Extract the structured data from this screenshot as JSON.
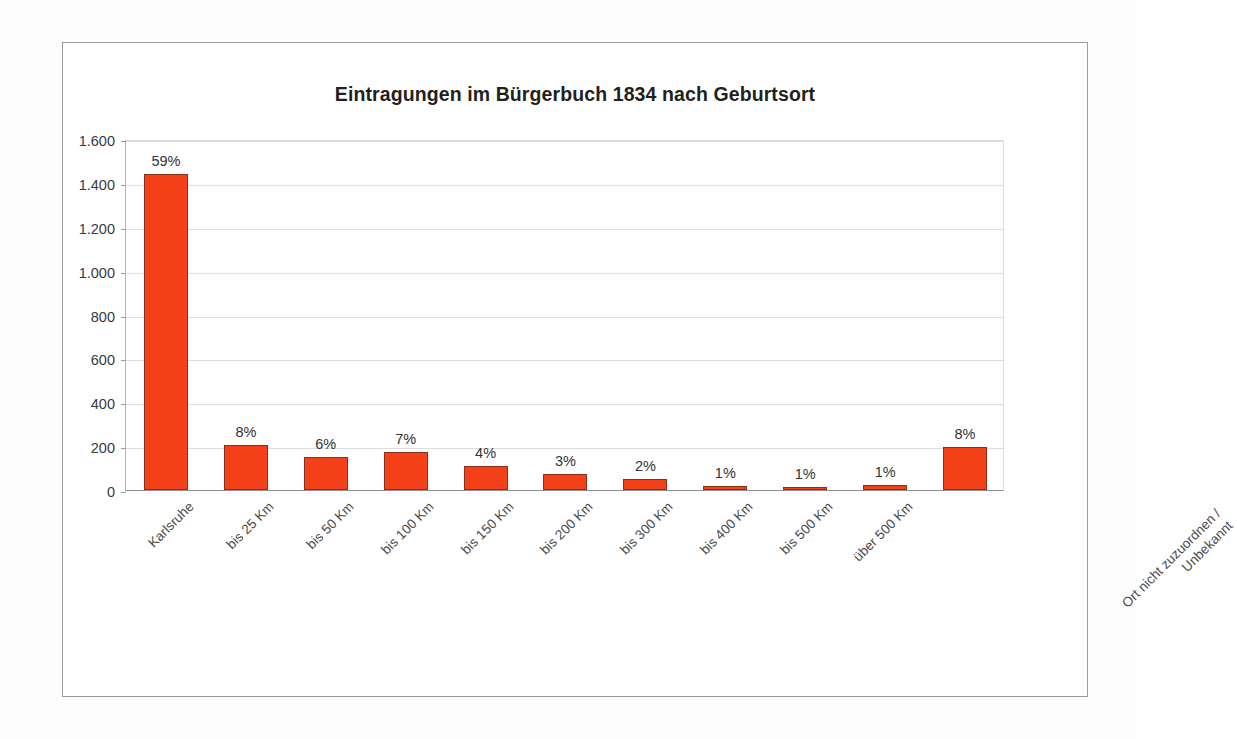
{
  "chart_data": {
    "type": "bar",
    "title": "Eintragungen im Bürgerbuch 1834 nach Geburtsort",
    "xlabel": "",
    "ylabel": "",
    "ylim": [
      0,
      1600
    ],
    "grid": true,
    "legend": false,
    "orientation": "vertical",
    "bar_color": "#f4411a",
    "bar_edge_color": "#8a2f18",
    "categories": [
      "Karlsruhe",
      "bis 25 Km",
      "bis 50 Km",
      "bis 100 Km",
      "bis 150 Km",
      "bis 200 Km",
      "bis 300 Km",
      "bis 400 Km",
      "bis 500 Km",
      "über 500 Km",
      "Ort nicht zuzuordnen / Unbekannt"
    ],
    "category_lines": [
      [
        "Karlsruhe"
      ],
      [
        "bis 25 Km"
      ],
      [
        "bis 50 Km"
      ],
      [
        "bis 100 Km"
      ],
      [
        "bis 150 Km"
      ],
      [
        "bis 200 Km"
      ],
      [
        "bis 300 Km"
      ],
      [
        "bis 400 Km"
      ],
      [
        "bis 500 Km"
      ],
      [
        "über 500 Km"
      ],
      [
        "Ort nicht zuzuordnen /",
        "Unbekannt"
      ]
    ],
    "values": [
      1440,
      205,
      150,
      175,
      110,
      75,
      50,
      20,
      12,
      25,
      195
    ],
    "data_labels": [
      "59%",
      "8%",
      "6%",
      "7%",
      "4%",
      "3%",
      "2%",
      "1%",
      "1%",
      "1%",
      "8%"
    ],
    "yticks": [
      0,
      200,
      400,
      600,
      800,
      1000,
      1200,
      1400,
      1600
    ],
    "ytick_labels": [
      "0",
      "200",
      "400",
      "600",
      "800",
      "1.000",
      "1.200",
      "1.400",
      "1.600"
    ]
  }
}
